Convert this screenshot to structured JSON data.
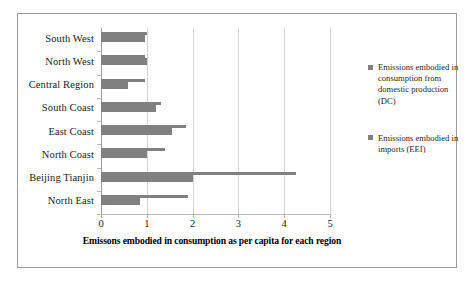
{
  "chart_data": {
    "type": "bar",
    "orientation": "horizontal",
    "title": "",
    "xlabel": "Emissons embodied in consumption as per capita for each region",
    "ylabel": "",
    "xlim": [
      0,
      5
    ],
    "xticks": [
      "0",
      "1",
      "2",
      "3",
      "4",
      "5"
    ],
    "grid": true,
    "legend_position": "right",
    "categories": [
      "South West",
      "North West",
      "Central Region",
      "South Coast",
      "East Coast",
      "North Coast",
      "Beijing Tianjin",
      "North East"
    ],
    "series": [
      {
        "name": "Emissions embodied in consumption from domestic production (DC)",
        "short_name": "DC",
        "color": "#808080",
        "values": [
          0.95,
          1.0,
          0.6,
          1.2,
          1.55,
          1.0,
          2.0,
          0.85
        ]
      },
      {
        "name": "Emissions embodied in imports (EEI)",
        "short_name": "EEI",
        "color": "#808080",
        "values": [
          1.0,
          0.95,
          0.95,
          1.3,
          1.85,
          1.4,
          4.25,
          1.9
        ]
      }
    ]
  },
  "legend": {
    "entries": [
      "Emissions embodied in consumption from domestic production (DC)",
      "Emissions embodied in imports (EEI)"
    ]
  },
  "axis": {
    "x_title": "Emissons embodied in consumption as per capita for each region",
    "tick_labels": [
      "0",
      "1",
      "2",
      "3",
      "4",
      "5"
    ]
  }
}
